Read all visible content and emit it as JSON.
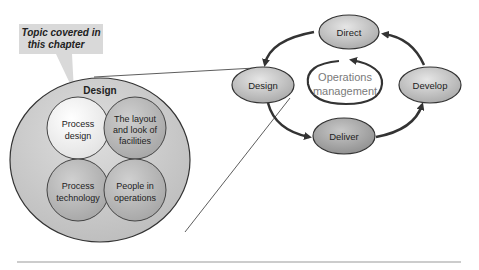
{
  "callout": {
    "line1": "Topic covered in",
    "line2": "this chapter",
    "bg_color": "#d9d9d9"
  },
  "design_detail": {
    "title": "Design",
    "quadrants": [
      {
        "line1": "Process",
        "line2": "design",
        "line3": ""
      },
      {
        "line1": "The layout",
        "line2": "and look of",
        "line3": "facilities"
      },
      {
        "line1": "Process",
        "line2": "technology",
        "line3": ""
      },
      {
        "line1": "People in",
        "line2": "operations",
        "line3": ""
      }
    ]
  },
  "cycle": {
    "center_line1": "Operations",
    "center_line2": "management",
    "nodes": [
      {
        "id": "direct",
        "label": "Direct"
      },
      {
        "id": "develop",
        "label": "Develop"
      },
      {
        "id": "deliver",
        "label": "Deliver"
      },
      {
        "id": "design",
        "label": "Design"
      }
    ]
  },
  "colors": {
    "node_fill": "#c8c8c8",
    "node_stroke": "#333333",
    "arrow": "#333333",
    "outer_circle": "#cfcfcf",
    "process_design_fill": "#f0f0f0",
    "quadrant_fill": "#bdbdbd",
    "rule": "#999999"
  }
}
